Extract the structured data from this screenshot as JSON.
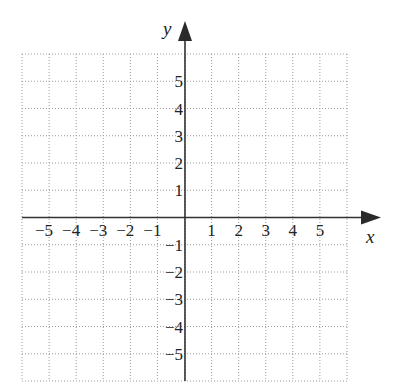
{
  "diagram": {
    "type": "coordinate-plane",
    "x_axis": {
      "label": "x",
      "min": -6,
      "max": 6,
      "tick_labels": [
        "-5",
        "-4",
        "-3",
        "-2",
        "-1",
        "1",
        "2",
        "3",
        "4",
        "5"
      ],
      "tick_values": [
        -5,
        -4,
        -3,
        -2,
        -1,
        1,
        2,
        3,
        4,
        5
      ]
    },
    "y_axis": {
      "label": "y",
      "min": -6,
      "max": 6,
      "tick_labels": [
        "5",
        "4",
        "3",
        "2",
        "1",
        "-1",
        "-2",
        "-3",
        "-4",
        "-5"
      ],
      "tick_values": [
        5,
        4,
        3,
        2,
        1,
        -1,
        -2,
        -3,
        -4,
        -5
      ]
    },
    "grid": {
      "enabled": true,
      "step": 1,
      "style": "dotted"
    },
    "colors": {
      "axis": "#333333",
      "grid": "#9a9a9a",
      "text": "#222222"
    }
  }
}
